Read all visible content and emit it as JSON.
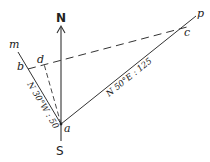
{
  "diagram": {
    "type": "survey-traverse",
    "compass": {
      "north_label": "N",
      "south_label": "S"
    },
    "points": {
      "a": "a",
      "b": "b",
      "c": "c",
      "d": "d",
      "m": "m",
      "p": "p"
    },
    "courses": [
      {
        "from": "a",
        "toward": "m",
        "label": "N 30°W : 50"
      },
      {
        "from": "a",
        "toward": "p",
        "label": "N 50°E : 125"
      }
    ],
    "dashed_lines": [
      "b-c (through d)",
      "a-d"
    ],
    "colors": {
      "line": "#333333",
      "text": "#222222",
      "background": "#ffffff"
    }
  }
}
